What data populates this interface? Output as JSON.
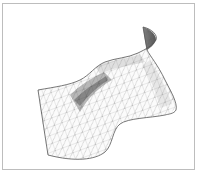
{
  "figure": {
    "frame_border_color": "#bdbdbd",
    "mesh_line_color": "#8a8a8a",
    "outline_color": "#555555",
    "shade_color": "#3a3a3a",
    "background_color": "#ffffff"
  }
}
